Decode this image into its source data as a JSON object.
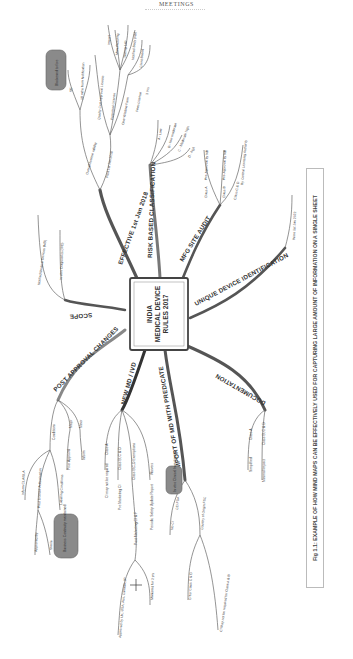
{
  "page": {
    "header": "MEETINGS"
  },
  "mindmap": {
    "center": {
      "lines": [
        "INDIA",
        "MEDICAL DEVICE",
        "RULES 2017"
      ]
    },
    "branches": {
      "effective": {
        "label": "EFFECTIVE 1st Jan 2018",
        "sub": {
          "validity": "Overall license validity",
          "post_1st_jan": "Post 1st Jan 2018",
          "bfore_label": "18 mths from Notification",
          "se_label": "SE",
          "note": "Blackened to fore",
          "perpetual": "Perpetual License",
          "quality_cert": "Quality Cert Approval License",
          "manufacturing": "Manufacturing",
          "testing_lab": "Testing Lab",
          "import": "Import",
          "notified_body": "Notified Body (NB)",
          "one_window": "One Window Form",
          "client_based": "Client Based",
          "fees_license": "Fees License",
          "three_yrs": "3 Yrs"
        }
      },
      "risk": {
        "label": "RISK BASED CLASSIFICATION",
        "items": [
          "A - Low",
          "B - low moderate",
          "C - Moderate high",
          "D - high"
        ]
      },
      "audit": {
        "label": "MFG SITE AUDIT",
        "items": [
          "Class A",
          "Class B",
          "Class C & D"
        ],
        "details": [
          "Pre-Approval by NB",
          "Pre-Approval by NB",
          "By Central Licensing Authority"
        ]
      },
      "udi": {
        "label": "UNIQUE DEVICE IDENTIFICATION",
        "item": "Wore 1st Jan 2022"
      },
      "documentation": {
        "label": "DOCUMENTATION",
        "items": [
          "Class A",
          "Class B, C & D"
        ],
        "details": [
          "Simplified",
          "Minimal Impact"
        ]
      },
      "import": {
        "label": "IMPORT OF MD WITH PREDICATE",
        "items": [
          "No CI",
          "CE/ FDA",
          "Country of Origin FSC"
        ],
        "sub": [
          "CI for Class C & D",
          "CI May not be required for Class A & B"
        ],
        "note": "In vitro Clinical Investigation"
      },
      "new": {
        "label": "NEW MD / IVD",
        "items": [
          "Class A",
          "Class B, C & D",
          "Class B,C,D Exemptions",
          "Waivers"
        ],
        "details": [
          "CI may not be required",
          "Pre Marketing CI",
          "Post Marketing CI & F",
          "Periodic Safety Update Report"
        ],
        "approved": "Approved by UK, USA, Aus, Canada, JP",
        "marketed": "Marketed for 2 yrs",
        "note": "CI Exemptions"
      },
      "post_approval": {
        "label": "POST APPROVAL CHANGES",
        "items": [
          "Major",
          "Minor"
        ],
        "details": [
          "Prior Approval",
          "Inform"
        ],
        "conditions": "Conditions",
        "inform": "Inform CLA/SLA",
        "major_lic": "Post License Authorisation",
        "no_sub": "Labelling Conditions",
        "approved_by": "Approved By",
        "sterile": "Sterile",
        "note": "Business Continuity maintained"
      },
      "scope": {
        "label": "SCOPE",
        "items": [
          "Notified Medical Devices (MD)",
          "In vitro Diagnostics (IVD)"
        ]
      }
    },
    "cursor": "+"
  },
  "caption": {
    "text": "Fig 1.1: EXAMPLE OF HOW MIND MAPS CAN BE EFFECTIVELY USED FOR CAPTURING LARGE AMOUNT OF INFORMATION ON A SINGLE SHEET"
  },
  "colors": {
    "branch": "#555555",
    "leaf_line": "#666666",
    "note_fill": "#8a8a8a",
    "caption_border": "#bbbbbb"
  }
}
